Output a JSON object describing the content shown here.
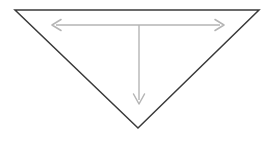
{
  "canvas": {
    "width": 273,
    "height": 142,
    "background_color": "#ffffff"
  },
  "shape": {
    "name": "inverted-triangle",
    "stroke_color": "#3a3a3a",
    "fill_color": "#ffffff",
    "stroke_width": 1.5,
    "vertices": {
      "top_left": {
        "x": 15,
        "y": 10
      },
      "top_right": {
        "x": 259,
        "y": 10
      },
      "bottom_apex": {
        "x": 138,
        "y": 128
      }
    },
    "points_attr": "15,10 259,10 138,128"
  },
  "dimensions": {
    "color": "#b5b5b5",
    "horizontal": {
      "name": "width-dimension-arrow",
      "label": "",
      "y": 25,
      "x_start": 52,
      "x_end": 224,
      "line_path": "M 56 25 L 220 25",
      "left_head_path": "M 61 19.5 L 52 25 L 61 30.5",
      "right_head_path": "M 215 19.5 L 224 25 L 215 30.5",
      "double_headed": true
    },
    "vertical": {
      "name": "depth-dimension-arrow",
      "label": "",
      "x": 139,
      "y_start": 25,
      "y_end": 104,
      "line_path": "M 139 25 L 139 100",
      "head_path": "M 133.5 94 L 139 104 L 144.5 94",
      "double_headed": false
    }
  }
}
